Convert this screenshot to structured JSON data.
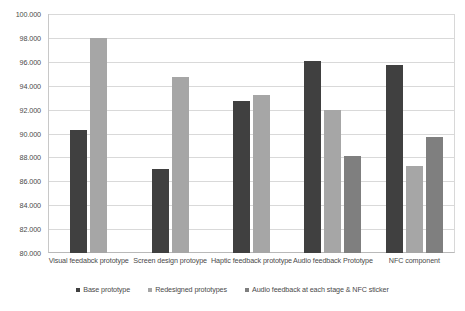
{
  "chart_data": {
    "type": "bar",
    "title": "",
    "xlabel": "",
    "ylabel": "",
    "ylim": [
      80.0,
      100.0
    ],
    "y_tick_step": 2.0,
    "grid": true,
    "legend_position": "bottom",
    "categories": [
      "Visual feedabck prototype",
      "Screen design protoype",
      "Haptic feedback prototype",
      "Audio feedback Prototype",
      "NFC component"
    ],
    "y_tick_labels": [
      "100.000",
      "98.000",
      "96.000",
      "94.000",
      "92.000",
      "90.000",
      "88.000",
      "86.000",
      "84.000",
      "82.000",
      "80.000"
    ],
    "y_tick_values": [
      100.0,
      98.0,
      96.0,
      94.0,
      92.0,
      90.0,
      88.0,
      86.0,
      84.0,
      82.0,
      80.0
    ],
    "series": [
      {
        "name": "Base prototype",
        "color": "#404040",
        "values": [
          90.3,
          87.0,
          92.7,
          96.1,
          95.7
        ]
      },
      {
        "name": "Redesigned prototypes",
        "color": "#a6a6a6",
        "values": [
          98.0,
          94.7,
          93.2,
          92.0,
          87.3
        ]
      },
      {
        "name": "Audio feedback at each stage & NFC sticker",
        "color": "#7f7f7f",
        "values": [
          null,
          null,
          null,
          88.1,
          89.7
        ]
      }
    ]
  }
}
